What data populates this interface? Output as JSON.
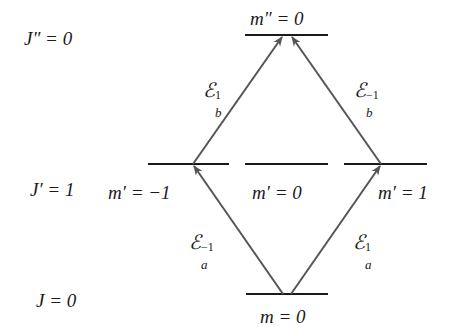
{
  "levels": {
    "upper": {
      "label": "J″ = 0",
      "sublevels": [
        {
          "label": "m″ = 0"
        }
      ]
    },
    "intermediate": {
      "label": "J′ = 1",
      "sublevels": [
        {
          "label": "m′ = −1"
        },
        {
          "label": "m′ = 0"
        },
        {
          "label": "m′ = 1"
        }
      ]
    },
    "ground": {
      "label": "J = 0",
      "sublevels": [
        {
          "label": "m = 0"
        }
      ]
    }
  },
  "transitions": [
    {
      "symbol": "ℰ",
      "sub": "a",
      "sup": "−1",
      "from": "m = 0",
      "to": "m′ = −1"
    },
    {
      "symbol": "ℰ",
      "sub": "a",
      "sup": "1",
      "from": "m = 0",
      "to": "m′ = 1"
    },
    {
      "symbol": "ℰ",
      "sub": "b",
      "sup": "1",
      "from": "m′ = −1",
      "to": "m″ = 0"
    },
    {
      "symbol": "ℰ",
      "sub": "b",
      "sup": "−1",
      "from": "m′ = 1",
      "to": "m″ = 0"
    }
  ],
  "colors": {
    "level_line": "#1a1a1a",
    "arrow": "#555555",
    "text": "#1a1a1a"
  }
}
